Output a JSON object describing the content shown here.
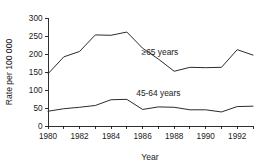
{
  "chart_data": {
    "type": "line",
    "title": "",
    "xlabel": "Year",
    "ylabel": "Rate per 100 000",
    "x": [
      1980,
      1981,
      1982,
      1983,
      1984,
      1985,
      1986,
      1987,
      1988,
      1989,
      1990,
      1991,
      1992,
      1993
    ],
    "xlim": [
      1980,
      1993
    ],
    "ylim": [
      0,
      300
    ],
    "xticks": [
      1980,
      1981,
      1982,
      1983,
      1984,
      1985,
      1986,
      1987,
      1988,
      1989,
      1990,
      1991,
      1992,
      1993
    ],
    "xtick_labels": [
      "1980",
      "",
      "1982",
      "",
      "1984",
      "",
      "1986",
      "",
      "1988",
      "",
      "1990",
      "",
      "1992",
      ""
    ],
    "yticks": [
      0,
      50,
      100,
      150,
      200,
      250,
      300
    ],
    "ytick_labels": [
      "0",
      "50",
      "100",
      "150",
      "200",
      "250",
      "300"
    ],
    "grid": false,
    "legend_position": "inline-annotation",
    "series": [
      {
        "name": "≥65 years",
        "label_x": 1987.1,
        "label_y": 196,
        "values": [
          145,
          192,
          207,
          253,
          252,
          261,
          216,
          186,
          152,
          163,
          162,
          163,
          212,
          197
        ]
      },
      {
        "name": "45-64 years",
        "label_x": 1987.0,
        "label_y": 84,
        "values": [
          41,
          48,
          52,
          57,
          73,
          74,
          46,
          53,
          52,
          45,
          45,
          39,
          54,
          55
        ]
      }
    ],
    "colors": {
      "line": "#2b2b2b",
      "axis": "#1a1a1a",
      "text": "#1a1a1a",
      "background": "#ffffff"
    }
  }
}
